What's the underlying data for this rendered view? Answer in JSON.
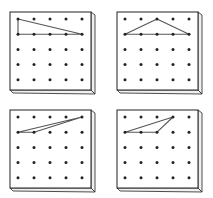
{
  "diagram": {
    "grid": {
      "rows": 5,
      "cols": 5
    },
    "colors": {
      "ink": "#222222",
      "band": "#555555",
      "board": "#ffffff",
      "side": "#f0f0f0"
    },
    "boards": [
      {
        "id": "top-left",
        "x": 10,
        "y": 12,
        "triangle": [
          [
            0,
            0
          ],
          [
            1,
            0
          ],
          [
            1,
            4
          ]
        ]
      },
      {
        "id": "top-right",
        "x": 117,
        "y": 12,
        "triangle": [
          [
            1,
            0
          ],
          [
            0,
            2
          ],
          [
            1,
            4
          ]
        ]
      },
      {
        "id": "bottom-left",
        "x": 10,
        "y": 110,
        "triangle": [
          [
            1,
            0
          ],
          [
            1,
            1
          ],
          [
            0,
            4
          ]
        ]
      },
      {
        "id": "bottom-right",
        "x": 117,
        "y": 110,
        "triangle": [
          [
            1,
            0
          ],
          [
            1,
            2
          ],
          [
            0,
            3
          ]
        ]
      }
    ]
  }
}
